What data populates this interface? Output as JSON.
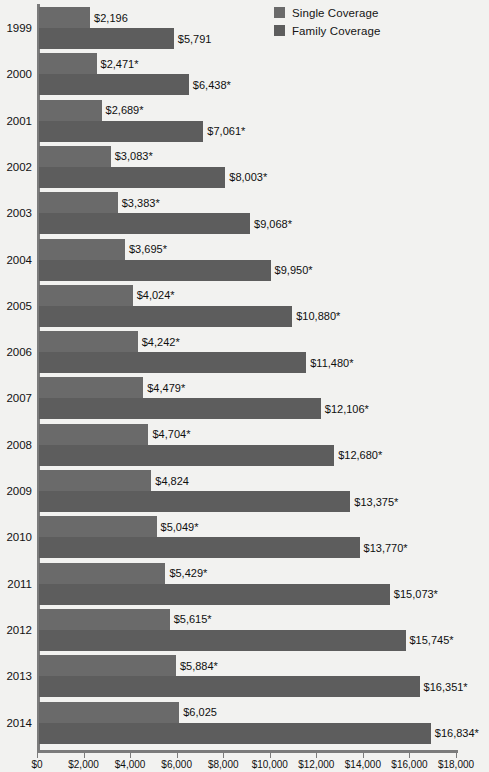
{
  "legend": {
    "items": [
      {
        "label": "Single Coverage",
        "color": "#6a6a6a",
        "icon": "legend-swatch-icon"
      },
      {
        "label": "Family Coverage",
        "color": "#5d5d5d",
        "icon": "legend-swatch-icon"
      }
    ]
  },
  "axis": {
    "ticks": [
      "$0",
      "$2,000",
      "$4,000",
      "$6,000",
      "$8,000",
      "$10,000",
      "$12,000",
      "$14,000",
      "$16,000",
      "$18,000"
    ],
    "min": 0,
    "max": 18000,
    "step": 2000
  },
  "chart_data": {
    "type": "bar",
    "title": "",
    "subtitle": "",
    "xlabel": "",
    "ylabel": "",
    "orientation": "horizontal",
    "grid": false,
    "legend_position": "top-right",
    "xlim": [
      0,
      18000
    ],
    "xticks": [
      0,
      2000,
      4000,
      6000,
      8000,
      10000,
      12000,
      14000,
      16000,
      18000
    ],
    "xticklabels": [
      "$0",
      "$2,000",
      "$4,000",
      "$6,000",
      "$8,000",
      "$10,000",
      "$12,000",
      "$14,000",
      "$16,000",
      "$18,000"
    ],
    "categories": [
      "1999",
      "2000",
      "2001",
      "2002",
      "2003",
      "2004",
      "2005",
      "2006",
      "2007",
      "2008",
      "2009",
      "2010",
      "2011",
      "2012",
      "2013",
      "2014"
    ],
    "series": [
      {
        "name": "Single Coverage",
        "color": "#6a6a6a",
        "values": [
          2196,
          2471,
          2689,
          3083,
          3383,
          3695,
          4024,
          4242,
          4479,
          4704,
          4824,
          5049,
          5429,
          5615,
          5884,
          6025
        ],
        "labels": [
          "$2,196",
          "$2,471*",
          "$2,689*",
          "$3,083*",
          "$3,383*",
          "$3,695*",
          "$4,024*",
          "$4,242*",
          "$4,479*",
          "$4,704*",
          "$4,824",
          "$5,049*",
          "$5,429*",
          "$5,615*",
          "$5,884*",
          "$6,025"
        ]
      },
      {
        "name": "Family Coverage",
        "color": "#5d5d5d",
        "values": [
          5791,
          6438,
          7061,
          8003,
          9068,
          9950,
          10880,
          11480,
          12106,
          12680,
          13375,
          13770,
          15073,
          15745,
          16351,
          16834
        ],
        "labels": [
          "$5,791",
          "$6,438*",
          "$7,061*",
          "$8,003*",
          "$9,068*",
          "$9,950*",
          "$10,880*",
          "$11,480*",
          "$12,106*",
          "$12,680*",
          "$13,375*",
          "$13,770*",
          "$15,073*",
          "$15,745*",
          "$16,351*",
          "$16,834*"
        ]
      }
    ]
  }
}
